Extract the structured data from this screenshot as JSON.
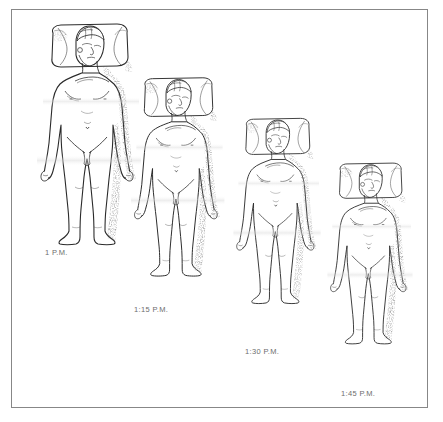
{
  "illustration": {
    "title": "Supine figure on pillow, sequential time series",
    "background_color": "#ffffff",
    "frame_color": "#878787",
    "ink_color": "#2b2b2b",
    "label_color": "#6e6e6e",
    "shadow_color": "#9a9a9a",
    "panel_count": 4
  },
  "panels": [
    {
      "id": "panel-1",
      "label": "1 P.M.",
      "index": 1,
      "scale": 1.0,
      "x": 26,
      "y": 18,
      "label_x": 44,
      "label_y": 245,
      "figure_name": "supine-male-figure-on-pillow"
    },
    {
      "id": "panel-2",
      "label": "1:15 P.M.",
      "index": 2,
      "scale": 0.9,
      "x": 121,
      "y": 72,
      "label_x": 133,
      "label_y": 303,
      "figure_name": "supine-male-figure-on-pillow"
    },
    {
      "id": "panel-3",
      "label": "1:30 P.M.",
      "index": 3,
      "scale": 0.84,
      "x": 224,
      "y": 113,
      "label_x": 244,
      "label_y": 345,
      "figure_name": "supine-male-figure-on-pillow"
    },
    {
      "id": "panel-4",
      "label": "1:45 P.M.",
      "index": 4,
      "scale": 0.82,
      "x": 318,
      "y": 158,
      "label_x": 340,
      "label_y": 387,
      "figure_name": "supine-male-figure-on-pillow"
    }
  ]
}
